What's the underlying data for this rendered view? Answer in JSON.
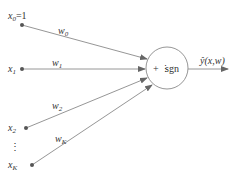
{
  "diagram": {
    "inputs": [
      {
        "label": "x",
        "sub": "0",
        "suffix": "=1",
        "weight": "w",
        "weight_sub": "0"
      },
      {
        "label": "x",
        "sub": "1",
        "suffix": "",
        "weight": "w",
        "weight_sub": "1"
      },
      {
        "label": "x",
        "sub": "2",
        "suffix": "",
        "weight": "w",
        "weight_sub": "2"
      },
      {
        "label": "x",
        "sub": "K",
        "suffix": "",
        "weight": "w",
        "weight_sub": "K"
      }
    ],
    "ellipsis": "⋮",
    "node_label_plus": "+",
    "node_label_sep": "⋮",
    "node_label_fn": "sgn",
    "output_label": "ŷ(x,w)",
    "colors": {
      "line": "#8a8a8a",
      "text": "#333333",
      "node": "#7a7a7a"
    }
  }
}
